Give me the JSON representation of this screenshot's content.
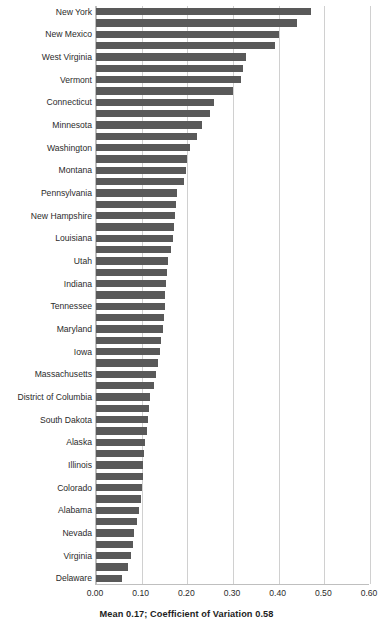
{
  "chart_data": {
    "type": "bar",
    "orientation": "horizontal",
    "title": "",
    "xlabel": "",
    "ylabel": "",
    "xlim": [
      0.0,
      0.6
    ],
    "xticks": [
      "0.00",
      "0.10",
      "0.20",
      "0.30",
      "0.40",
      "0.50",
      "0.60"
    ],
    "xtick_values": [
      0.0,
      0.1,
      0.2,
      0.3,
      0.4,
      0.5,
      0.6
    ],
    "grid": true,
    "legend": "none",
    "bar_color": "#595959",
    "gridline_color": "#d0d0d0",
    "axis_color": "#bfbfbf",
    "footnote": "Mean 0.17; Coefficient of Variation 0.58",
    "labeled_every_n": 2,
    "categories": [
      "New York",
      "Alaska2",
      "New Mexico",
      "Rhode Island",
      "West Virginia",
      "Oregon",
      "Vermont",
      "Maine",
      "Connecticut",
      "California",
      "Minnesota",
      "Wisconsin",
      "Washington",
      "New Jersey",
      "Montana",
      "Ohio",
      "Pennsylvania",
      "Michigan",
      "New Hampshire",
      "Arkansas",
      "Louisiana",
      "North Dakota",
      "Utah",
      "Kentucky",
      "Indiana",
      "Missouri",
      "Tennessee",
      "Oklahoma",
      "Maryland",
      "North Carolina",
      "Iowa",
      "Kansas",
      "Massachusetts",
      "Hawaii",
      "District of Columbia",
      "Idaho",
      "South Dakota",
      "Mississippi",
      "Alaska",
      "Nebraska",
      "Illinois",
      "South Carolina",
      "Colorado",
      "Arizona",
      "Alabama",
      "Florida",
      "Nevada",
      "Texas",
      "Virginia",
      "Georgia",
      "Delaware"
    ],
    "visible_labels": [
      "New York",
      "New Mexico",
      "West Virginia",
      "Vermont",
      "Connecticut",
      "Minnesota",
      "Washington",
      "Montana",
      "Pennsylvania",
      "New Hampshire",
      "Louisiana",
      "Utah",
      "Indiana",
      "Tennessee",
      "Maryland",
      "Iowa",
      "Massachusetts",
      "District of Columbia",
      "South Dakota",
      "Alaska",
      "Illinois",
      "Colorado",
      "Alabama",
      "Nevada",
      "Virginia",
      "Delaware"
    ],
    "values": [
      0.47,
      0.44,
      0.4,
      0.392,
      0.328,
      0.322,
      0.318,
      0.3,
      0.258,
      0.25,
      0.232,
      0.222,
      0.205,
      0.2,
      0.198,
      0.192,
      0.178,
      0.176,
      0.172,
      0.17,
      0.168,
      0.164,
      0.158,
      0.156,
      0.154,
      0.152,
      0.15,
      0.148,
      0.146,
      0.142,
      0.14,
      0.136,
      0.132,
      0.126,
      0.118,
      0.116,
      0.114,
      0.112,
      0.108,
      0.106,
      0.104,
      0.102,
      0.1,
      0.098,
      0.094,
      0.09,
      0.084,
      0.082,
      0.076,
      0.07,
      0.058
    ]
  }
}
